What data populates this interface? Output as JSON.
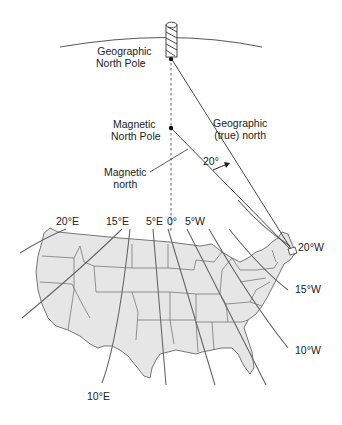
{
  "diagram": {
    "labels": {
      "geographic_north_pole": [
        "Geographic",
        "North Pole"
      ],
      "magnetic_north_pole": [
        "Magnetic",
        "North Pole"
      ],
      "geographic_true_north": [
        "Geographic",
        "(true) north"
      ],
      "magnetic_north": [
        "Magnetic",
        "north"
      ],
      "angle": "20°"
    },
    "isogonic_lines": [
      {
        "label": "20°E"
      },
      {
        "label": "15°E"
      },
      {
        "label": "10°E"
      },
      {
        "label": "5°E"
      },
      {
        "label": "0°"
      },
      {
        "label": "5°W"
      },
      {
        "label": "10°W"
      },
      {
        "label": "15°W"
      },
      {
        "label": "20°W"
      }
    ],
    "colors": {
      "map_fill": "#e6e6e6",
      "lines": "#555555",
      "text": "#222222"
    }
  }
}
